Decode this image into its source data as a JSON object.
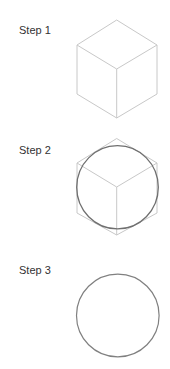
{
  "steps": [
    {
      "label": "Step 1",
      "content": "isometric cube"
    },
    {
      "label": "Step 2",
      "content": "circle inscribed in cube outline"
    },
    {
      "label": "Step 3",
      "content": "circle"
    }
  ],
  "colors": {
    "background": "#ffffff",
    "cube_lines": "#c8c8c8",
    "circle_stroke": "#777777",
    "label_text": "#333333"
  }
}
